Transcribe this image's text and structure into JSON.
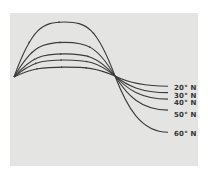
{
  "chart_data": {
    "type": "line",
    "title": "",
    "xlabel": "",
    "ylabel": "",
    "grid": false,
    "legend_position": "inline-right",
    "x": [
      0,
      0.125,
      0.25,
      0.375,
      0.5,
      0.625,
      0.75,
      0.875,
      1.0
    ],
    "series": [
      {
        "name": "20° N",
        "amplitude": 0.18,
        "values": [
          0,
          0.13,
          0.18,
          0.13,
          0,
          -0.04,
          -0.07,
          -0.09,
          -0.1
        ]
      },
      {
        "name": "30° N",
        "amplitude": 0.31,
        "values": [
          0,
          0.22,
          0.31,
          0.22,
          0,
          -0.08,
          -0.13,
          -0.16,
          -0.17
        ]
      },
      {
        "name": "40° N",
        "amplitude": 0.42,
        "values": [
          0,
          0.3,
          0.42,
          0.3,
          0,
          -0.11,
          -0.18,
          -0.22,
          -0.24
        ]
      },
      {
        "name": "50° N",
        "amplitude": 0.63,
        "values": [
          0,
          0.45,
          0.63,
          0.45,
          0,
          -0.16,
          -0.27,
          -0.33,
          -0.36
        ]
      },
      {
        "name": "60° N",
        "amplitude": 1.0,
        "values": [
          0,
          0.71,
          1.0,
          0.71,
          0,
          -0.27,
          -0.46,
          -0.57,
          -0.6
        ]
      }
    ],
    "annotations": [
      "All curves share a common start point and cross at a common node"
    ]
  },
  "labels": [
    "20° N",
    "30° N",
    "40° N",
    "50° N",
    "60° N"
  ],
  "colors": {
    "panel": "#e4e4e2",
    "line": "#3a3a3a"
  }
}
